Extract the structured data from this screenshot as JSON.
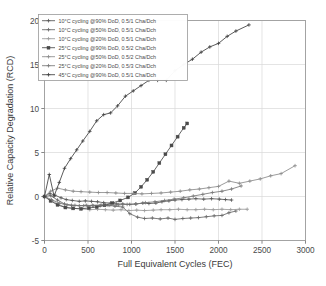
{
  "chart_data": {
    "type": "line",
    "title": "",
    "xlabel": "Full Equivalent Cycles (FEC)",
    "ylabel": "Relative Capacity Degradation (RCD)",
    "xlim": [
      0,
      3000
    ],
    "ylim": [
      -5,
      20
    ],
    "xticks": [
      0,
      500,
      1000,
      1500,
      2000,
      2500,
      3000
    ],
    "yticks": [
      -5,
      0,
      5,
      10,
      15,
      20
    ],
    "xtick_labels": [
      "0",
      "500",
      "1000",
      "1500",
      "2000",
      "2500",
      "3000"
    ],
    "ytick_labels": [
      "-5",
      "0",
      "5",
      "10",
      "15",
      "20"
    ],
    "grid": true,
    "legend_position": "upper-left",
    "series": [
      {
        "name": "10°C cycling @90% DoD, 0.5/1 Cha/Dch",
        "marker": "plus",
        "color": "#555555",
        "x": [
          0,
          60,
          120,
          190,
          250,
          320,
          400,
          470,
          540,
          610,
          680,
          760,
          830,
          900,
          980,
          1050,
          1130,
          1200,
          1280,
          1350,
          1430,
          1500,
          1580,
          1660,
          1740,
          1830,
          1920,
          2010,
          2080,
          2150
        ],
        "y": [
          0.0,
          0.35,
          0.15,
          -0.15,
          -0.35,
          -0.45,
          -0.55,
          -0.5,
          -0.55,
          -0.6,
          -0.7,
          -0.75,
          -0.85,
          -0.85,
          -0.9,
          -0.85,
          -0.75,
          -0.8,
          -0.75,
          -0.6,
          -0.5,
          -0.4,
          -0.35,
          -0.3,
          -0.25,
          -0.3,
          -0.25,
          -0.3,
          -0.35,
          -0.4
        ]
      },
      {
        "name": "10°C cycling @50% DoD, 0.5/1 Cha/Dch",
        "marker": "plus",
        "color": "#666666",
        "x": [
          0,
          70,
          150,
          230,
          310,
          400,
          480,
          560,
          640,
          730,
          810,
          900,
          980,
          1070,
          1150,
          1240,
          1330,
          1420,
          1500,
          1590,
          1680,
          1770,
          1860,
          1950,
          2040,
          2120,
          2200
        ],
        "y": [
          0.0,
          0.1,
          -0.4,
          -0.85,
          -1.0,
          -1.05,
          -1.0,
          -1.05,
          -1.05,
          -1.0,
          -1.1,
          -1.2,
          -1.95,
          -2.35,
          -2.5,
          -2.45,
          -2.55,
          -2.45,
          -2.6,
          -2.5,
          -2.45,
          -2.4,
          -2.3,
          -2.2,
          -2.15,
          -1.85,
          -1.65
        ]
      },
      {
        "name": "10°C cycling @20% DoD, 0.5/1 Cha/Dch",
        "marker": "plus",
        "color": "#9a9a9a",
        "x": [
          0,
          80,
          160,
          250,
          340,
          430,
          520,
          610,
          700,
          790,
          880,
          970,
          1060,
          1150,
          1250,
          1340,
          1440,
          1540,
          1640,
          1740,
          1840,
          1940,
          2040,
          2140,
          2240,
          2330
        ],
        "y": [
          0.0,
          -0.45,
          -0.9,
          -1.25,
          -1.35,
          -1.4,
          -1.5,
          -1.45,
          -1.5,
          -1.55,
          -1.5,
          -1.6,
          -1.55,
          -1.6,
          -1.55,
          -1.5,
          -1.5,
          -1.45,
          -1.5,
          -1.5,
          -1.45,
          -1.5,
          -1.45,
          -1.5,
          -1.45,
          -1.45
        ]
      },
      {
        "name": "25°C cycling @90% DoD, 0.5/2 Cha/Dch",
        "marker": "square",
        "color": "#4a4a4a",
        "x": [
          0,
          70,
          150,
          240,
          330,
          420,
          510,
          600,
          690,
          780,
          870,
          960,
          1040,
          1110,
          1180,
          1250,
          1320,
          1390,
          1460,
          1530,
          1600,
          1640
        ],
        "y": [
          0.0,
          -0.5,
          -0.95,
          -1.25,
          -1.35,
          -1.4,
          -1.3,
          -1.2,
          -1.0,
          -0.75,
          -0.45,
          -0.1,
          0.4,
          1.1,
          1.9,
          2.8,
          3.8,
          4.8,
          5.8,
          6.8,
          7.8,
          8.3
        ]
      },
      {
        "name": "25°C cycling @50% DoD, 0.5/2 Cha/Dch",
        "marker": "plus",
        "color": "#8a8a8a",
        "x": [
          0,
          70,
          150,
          240,
          330,
          420,
          520,
          620,
          720,
          820,
          920,
          1020,
          1120,
          1230,
          1340,
          1450,
          1560,
          1670,
          1780,
          1890,
          2000,
          2120,
          2240,
          2360,
          2480,
          2600,
          2720,
          2880
        ],
        "y": [
          0.0,
          0.6,
          0.95,
          0.75,
          0.6,
          0.55,
          0.5,
          0.45,
          0.45,
          0.4,
          0.35,
          0.35,
          0.3,
          0.35,
          0.4,
          0.5,
          0.6,
          0.75,
          0.85,
          1.0,
          1.15,
          1.75,
          1.5,
          1.75,
          2.0,
          2.35,
          2.6,
          3.5
        ]
      },
      {
        "name": "25°C cycling @20% DoD, 0.5/3 Cha/Dch",
        "marker": "plus",
        "color": "#777777",
        "x": [
          0,
          80,
          170,
          260,
          350,
          450,
          550,
          650,
          750,
          850,
          950,
          1050,
          1160,
          1270,
          1380,
          1490,
          1600,
          1710,
          1820,
          1930,
          2040,
          2150,
          2260
        ],
        "y": [
          0.0,
          -0.35,
          -0.75,
          -0.95,
          -1.0,
          -1.05,
          -1.0,
          -0.95,
          -1.0,
          -0.95,
          -0.9,
          -0.85,
          -0.7,
          -0.6,
          -0.45,
          -0.3,
          -0.15,
          0.05,
          0.25,
          0.45,
          0.6,
          0.85,
          1.2
        ]
      },
      {
        "name": "45°C cycling @90% DoD, 0.5/1 Cha/Dch",
        "marker": "plus",
        "color": "#3f3f3f",
        "x": [
          0,
          55,
          110,
          170,
          230,
          300,
          370,
          440,
          520,
          600,
          680,
          760,
          840,
          930,
          1020,
          1110,
          1200,
          1300,
          1400,
          1500,
          1600,
          1700,
          1800,
          1900,
          2000,
          2100,
          2200,
          2350
        ],
        "y": [
          0.0,
          2.5,
          0.05,
          1.6,
          3.2,
          4.3,
          5.3,
          6.3,
          7.4,
          8.6,
          9.3,
          9.5,
          10.3,
          11.4,
          12.0,
          12.6,
          13.2,
          13.2,
          13.2,
          14.3,
          15.0,
          15.6,
          16.4,
          17.0,
          17.4,
          18.2,
          18.8,
          19.5
        ]
      }
    ]
  }
}
